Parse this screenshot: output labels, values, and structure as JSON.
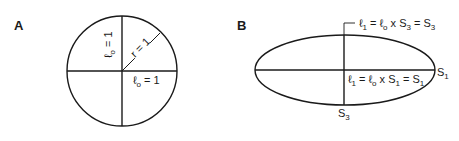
{
  "panels": [
    {
      "id": "A",
      "label": "A",
      "shape": "circle",
      "vertical_label": {
        "symbol": "ℓ",
        "sub": "o",
        "rest": " = 1"
      },
      "radius_label": "r = 1",
      "horizontal_label": {
        "symbol": "ℓ",
        "sub": "o",
        "rest": " = 1"
      }
    },
    {
      "id": "B",
      "label": "B",
      "shape": "ellipse",
      "top_label": {
        "symbol": "ℓ",
        "sub1": "1",
        "mid": " = ℓ",
        "sub2": "o",
        "mid2": " x S",
        "sub3": "3",
        "mid3": " = S",
        "sub4": "3"
      },
      "inner_label": {
        "symbol": "ℓ",
        "sub1": "1",
        "mid": " = ℓ",
        "sub2": "o",
        "mid2": " x S",
        "sub3": "1",
        "mid3": " = S",
        "sub4": "1"
      },
      "right_axis_label": {
        "base": "S",
        "sub": "1"
      },
      "bottom_axis_label": {
        "base": "S",
        "sub": "3"
      }
    }
  ],
  "colors": {
    "stroke": "#1a1a1a",
    "background": "#ffffff"
  }
}
